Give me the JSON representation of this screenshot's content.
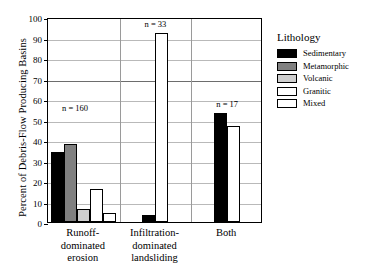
{
  "chart_data": {
    "type": "bar",
    "title": "",
    "xlabel": "",
    "ylabel": "Percent of Debris-Flow Producing Basins",
    "ylim": [
      0,
      100
    ],
    "ytick_step": 10,
    "yticks": [
      100,
      90,
      80,
      70,
      60,
      50,
      40,
      30,
      20,
      10,
      0
    ],
    "grid": true,
    "legend_position": "right",
    "legend_title": "Lithology",
    "categories": [
      "Runoff-\ndominated\nerosion",
      "Infiltration-\ndominated\nlandsliding",
      "Both"
    ],
    "group_annotations": [
      "n = 160",
      "n = 33",
      "n = 17"
    ],
    "series": [
      {
        "name": "Sedimentary",
        "color": "#000000",
        "values": [
          34,
          3.5,
          53
        ]
      },
      {
        "name": "Metamorphic",
        "color": "#808080",
        "values": [
          38,
          null,
          null
        ]
      },
      {
        "name": "Volcanic",
        "color": "#cfcfcf",
        "values": [
          6.5,
          null,
          null
        ]
      },
      {
        "name": "Granitic",
        "color": "#ffffff",
        "values": [
          16,
          92,
          47
        ]
      },
      {
        "name": "Mixed",
        "color": "#ffffff",
        "values": [
          4.5,
          null,
          null
        ]
      }
    ]
  },
  "legend": {
    "title": "Lithology",
    "items": [
      {
        "label": "Sedimentary",
        "color": "#000000"
      },
      {
        "label": "Metamorphic",
        "color": "#808080"
      },
      {
        "label": "Volcanic",
        "color": "#cfcfcf"
      },
      {
        "label": "Granitic",
        "color": "#ffffff"
      },
      {
        "label": "Mixed",
        "color": "#ffffff"
      }
    ]
  },
  "axis": {
    "y_title": "Percent of Debris-Flow Producing Basins"
  }
}
